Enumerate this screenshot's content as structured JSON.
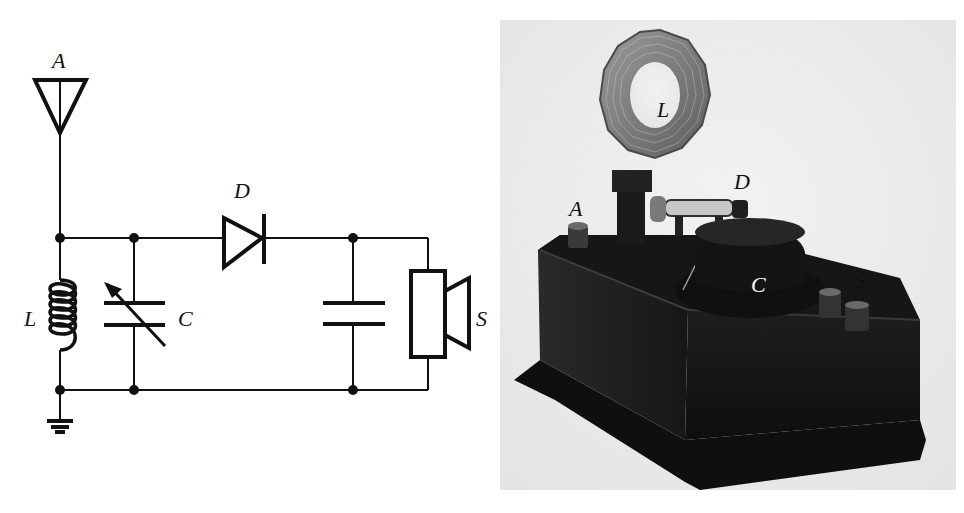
{
  "figure": {
    "schematic": {
      "title": "Crystal radio receiver circuit",
      "labels": {
        "antenna": "A",
        "diode": "D",
        "inductor": "L",
        "capacitor": "C",
        "speaker": "S"
      },
      "components": [
        {
          "id": "A",
          "type": "antenna"
        },
        {
          "id": "L",
          "type": "inductor"
        },
        {
          "id": "C",
          "type": "variable-capacitor"
        },
        {
          "id": "D",
          "type": "diode"
        },
        {
          "id": "C2",
          "type": "capacitor"
        },
        {
          "id": "S",
          "type": "speaker"
        },
        {
          "id": "G",
          "type": "ground"
        }
      ]
    },
    "photo": {
      "description": "Photograph of a vintage crystal radio set in a dark box",
      "labels": {
        "coil": "L",
        "diode": "D",
        "antenna_terminal": "A",
        "tuning_knob": "C",
        "speaker_terminals": "S"
      }
    }
  }
}
